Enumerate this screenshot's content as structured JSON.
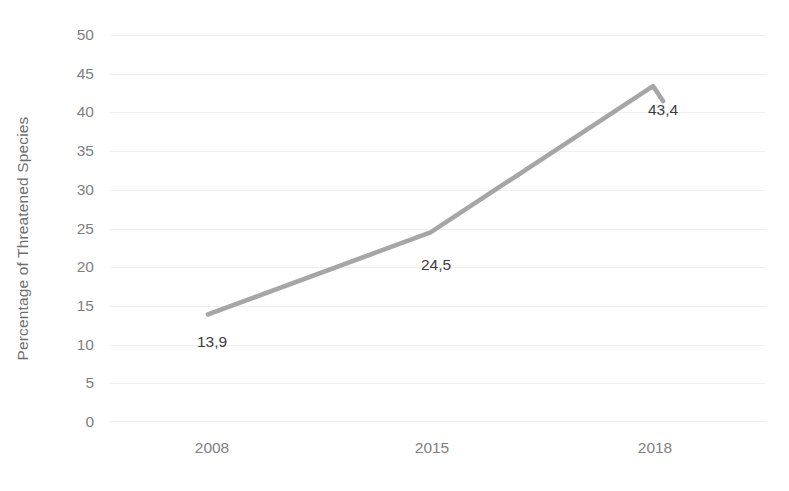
{
  "chart_data": {
    "type": "line",
    "title": "",
    "xlabel": "",
    "ylabel": "Percentage of Threatened Species",
    "categories": [
      "2008",
      "2015",
      "2018"
    ],
    "values": [
      13.9,
      24.5,
      43.4
    ],
    "data_labels": [
      "13,9",
      "24,5",
      "43,4"
    ],
    "ylim": [
      0,
      50
    ],
    "y_ticks": [
      "0",
      "5",
      "10",
      "15",
      "20",
      "25",
      "30",
      "35",
      "40",
      "45",
      "50"
    ],
    "y_tick_values": [
      0,
      5,
      10,
      15,
      20,
      25,
      30,
      35,
      40,
      45,
      50
    ],
    "grid": true,
    "legend": "none",
    "series_color": "#a6a6a6",
    "gridline_color": "#f0f0f0",
    "tick_label_color": "#7f7f7f",
    "data_label_color": "#3d3d3d",
    "background_color": "#ffffff"
  }
}
